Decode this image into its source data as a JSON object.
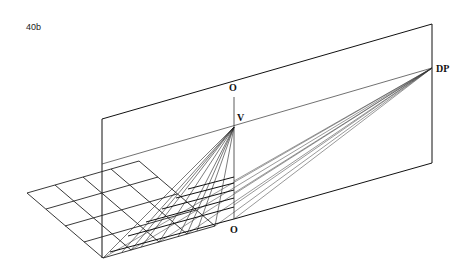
{
  "figure": {
    "label": "40b",
    "points": {
      "O_top": "O",
      "V": "V",
      "DP": "DP",
      "O_bottom": "O"
    }
  },
  "colors": {
    "ink": "#111111",
    "ink_light": "#555555",
    "background": "#ffffff"
  }
}
